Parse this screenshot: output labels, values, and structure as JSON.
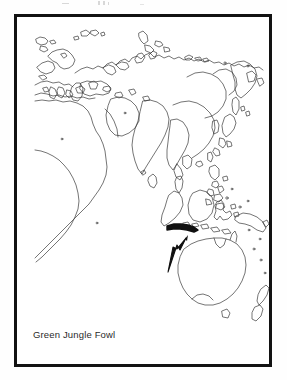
{
  "page": {
    "background_color": "#fefefe",
    "width": 287,
    "height": 380
  },
  "scan_artifacts": {
    "present": true,
    "description": "faint-speckles-top-edge",
    "color": "#d8d8d8"
  },
  "figure": {
    "frame": {
      "border_color": "#121212",
      "border_width_px": 3,
      "fill_color": "#ffffff"
    },
    "caption": "Green Jungle Fowl",
    "caption_color": "#2a2a2a"
  },
  "map": {
    "type": "range-map",
    "projection_hint": "eastern-hemisphere",
    "line_color": "#3a3a3a",
    "line_width_px": 0.7,
    "fill_color": "none",
    "regions_depicted": [
      "Europe",
      "Africa",
      "Arabian Peninsula",
      "Russia / Siberia",
      "India",
      "China",
      "Japan",
      "Korea",
      "Southeast Asia",
      "Philippines",
      "Indonesia",
      "New Guinea",
      "Australia",
      "New Zealand"
    ],
    "range_highlight": {
      "label": "Java",
      "color": "#101010",
      "description": "thickened-darkened-island-outline"
    },
    "pointer": {
      "shape": "arrow",
      "color": "#101010",
      "direction": "up-right",
      "points_to": "Java",
      "tail_x": 151,
      "tail_y": 254,
      "tip_x": 169,
      "tip_y": 222
    }
  }
}
